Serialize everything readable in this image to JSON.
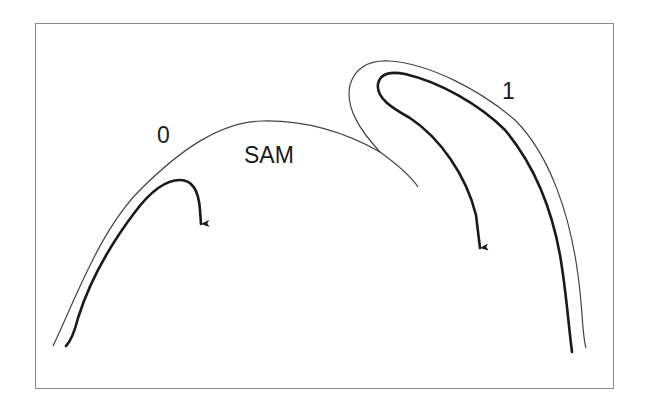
{
  "diagram": {
    "labels": {
      "primordium_0": "0",
      "meristem": "SAM",
      "primordium_1": "1"
    },
    "colors": {
      "stroke": "#1a1a1a",
      "thin_stroke": "#444444",
      "frame": "#8a8a8a",
      "background": "#ffffff"
    }
  }
}
